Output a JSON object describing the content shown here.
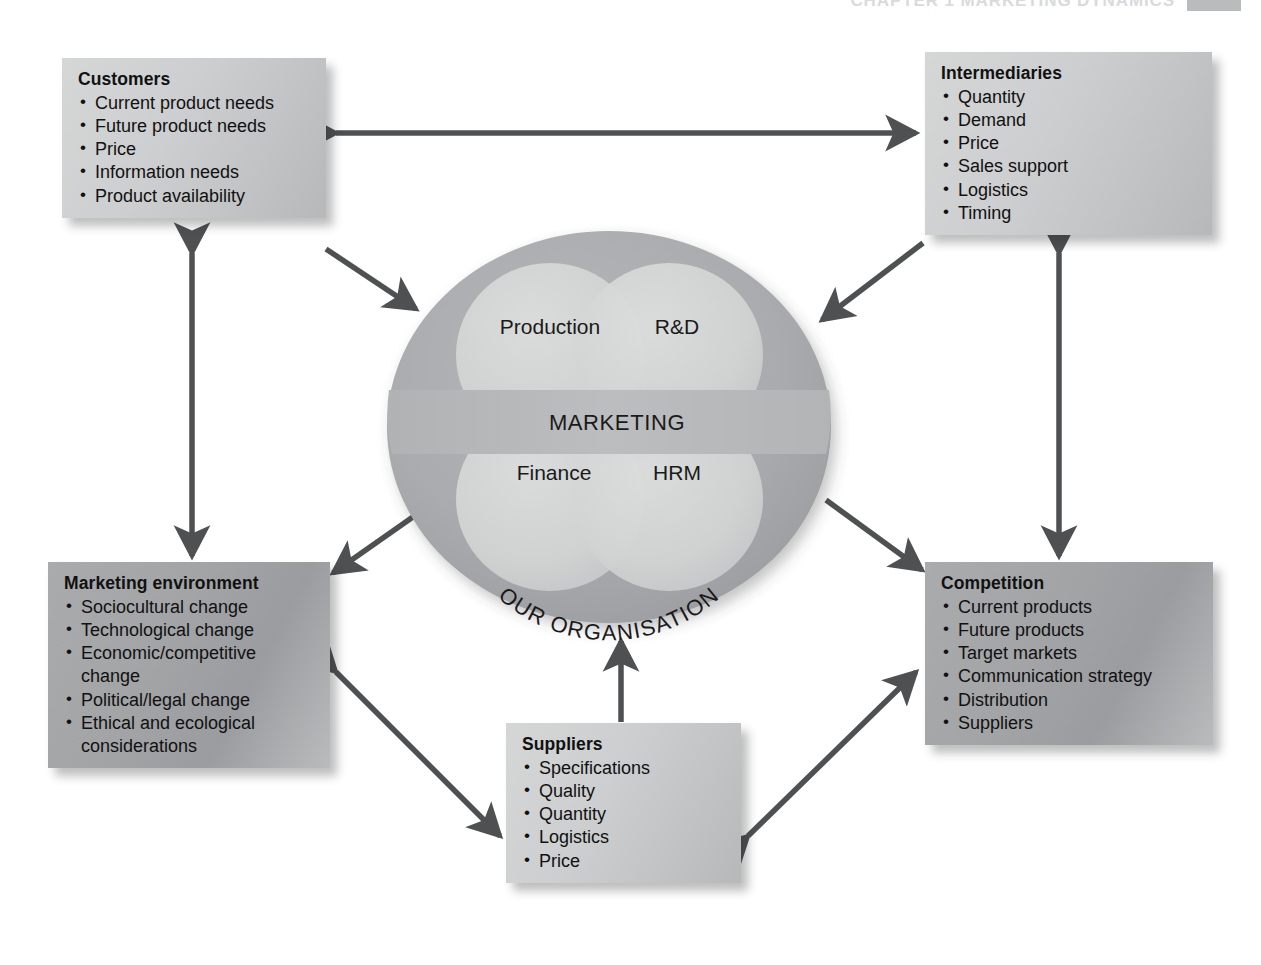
{
  "page": {
    "running_head": "CHAPTER 1 MARKETING DYNAMICS",
    "colors": {
      "box_light": "#cdcecf",
      "box_dark": "#a2a4a6",
      "circle_outer": "#a9abae",
      "circle_petal": "#d2d3d3",
      "marketing_band": "#b9babb",
      "arrow": "#4e5052",
      "text": "#111111"
    }
  },
  "boxes": {
    "customers": {
      "title": "Customers",
      "items": [
        "Current product needs",
        "Future product needs",
        "Price",
        "Information needs",
        "Product availability"
      ]
    },
    "intermediaries": {
      "title": "Intermediaries",
      "items": [
        "Quantity",
        "Demand",
        "Price",
        "Sales support",
        "Logistics",
        "Timing"
      ]
    },
    "environment": {
      "title": "Marketing environment",
      "items": [
        "Sociocultural change",
        "Technological change",
        "Economic/competitive change",
        "Political/legal change",
        "Ethical and ecological considerations"
      ]
    },
    "competition": {
      "title": "Competition",
      "items": [
        "Current products",
        "Future products",
        "Target markets",
        "Communication strategy",
        "Distribution",
        "Suppliers"
      ]
    },
    "suppliers": {
      "title": "Suppliers",
      "items": [
        "Specifications",
        "Quality",
        "Quantity",
        "Logistics",
        "Price"
      ]
    }
  },
  "organisation": {
    "caption": "OUR ORGANISATION",
    "centre_band": "MARKETING",
    "functions": [
      {
        "key": "production",
        "label": "Production"
      },
      {
        "key": "rnd",
        "label": "R&D"
      },
      {
        "key": "finance",
        "label": "Finance"
      },
      {
        "key": "hrm",
        "label": "HRM"
      }
    ]
  },
  "connections": [
    {
      "from": "customers",
      "to": "intermediaries",
      "heads": "double",
      "orientation": "horizontal"
    },
    {
      "from": "customers",
      "to": "environment",
      "heads": "double",
      "orientation": "vertical"
    },
    {
      "from": "intermediaries",
      "to": "competition",
      "heads": "double",
      "orientation": "vertical"
    },
    {
      "from": "customers",
      "to": "organisation",
      "heads": "single",
      "orientation": "diagonal"
    },
    {
      "from": "intermediaries",
      "to": "organisation",
      "heads": "single",
      "orientation": "diagonal"
    },
    {
      "from": "organisation",
      "to": "environment",
      "heads": "single",
      "orientation": "diagonal"
    },
    {
      "from": "organisation",
      "to": "competition",
      "heads": "single",
      "orientation": "diagonal"
    },
    {
      "from": "suppliers",
      "to": "organisation",
      "heads": "single",
      "orientation": "vertical"
    },
    {
      "from": "environment",
      "to": "suppliers",
      "heads": "double",
      "orientation": "diagonal"
    },
    {
      "from": "suppliers",
      "to": "competition",
      "heads": "double",
      "orientation": "diagonal"
    }
  ]
}
